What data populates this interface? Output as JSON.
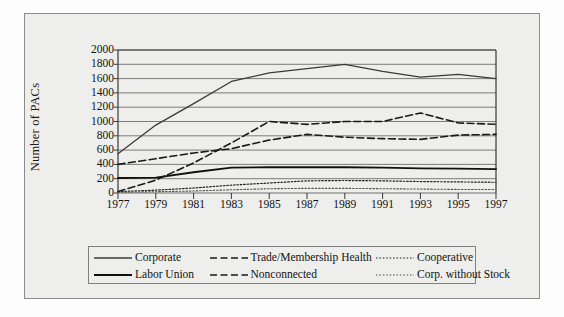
{
  "figure": {
    "background_color": "#eeeeec",
    "frame_color": "#8b8b8b"
  },
  "chart_data": {
    "type": "line",
    "title": "",
    "xlabel": "",
    "ylabel": "Number of PACs",
    "xlim": [
      1977,
      1997
    ],
    "ylim": [
      0,
      2000
    ],
    "ytick_values": [
      0,
      200,
      400,
      600,
      800,
      1000,
      1200,
      1400,
      1600,
      1800,
      2000
    ],
    "ytick_labels": [
      "0",
      "200",
      "400",
      "600",
      "800",
      "1000",
      "1200",
      "1400",
      "1600",
      "1800",
      "2000"
    ],
    "xtick_values": [
      1977,
      1979,
      1981,
      1983,
      1985,
      1987,
      1989,
      1991,
      1993,
      1995,
      1997
    ],
    "xtick_labels": [
      "1977",
      "1979",
      "1981",
      "1983",
      "1985",
      "1987",
      "1989",
      "1991",
      "1993",
      "1995",
      "1997"
    ],
    "grid": "horizontal",
    "legend_position": "below-axes",
    "x": [
      1977,
      1979,
      1981,
      1983,
      1985,
      1987,
      1989,
      1991,
      1993,
      1995,
      1997
    ],
    "series": [
      {
        "name": "Corporate",
        "style": "solid",
        "color": "#3a3a3a",
        "width": 1.3,
        "values": [
          550,
          950,
          1250,
          1560,
          1680,
          1740,
          1800,
          1700,
          1620,
          1660,
          1600
        ]
      },
      {
        "name": "Trade/Membership Health",
        "style": "dashed",
        "color": "#1a1a1a",
        "width": 1.6,
        "values": [
          400,
          480,
          560,
          620,
          740,
          820,
          780,
          760,
          750,
          810,
          820
        ]
      },
      {
        "name": "Cooperative",
        "style": "dotted",
        "color": "#222222",
        "width": 1.2,
        "values": [
          20,
          40,
          70,
          110,
          140,
          170,
          175,
          170,
          160,
          155,
          150
        ]
      },
      {
        "name": "Labor Union",
        "style": "solid",
        "color": "#101010",
        "width": 1.8,
        "values": [
          210,
          215,
          290,
          355,
          360,
          360,
          360,
          355,
          345,
          340,
          335
        ]
      },
      {
        "name": "Nonconnected",
        "style": "dashed",
        "color": "#1a1a1a",
        "width": 1.6,
        "values": [
          20,
          180,
          420,
          700,
          1000,
          960,
          1000,
          1000,
          1120,
          980,
          960
        ]
      },
      {
        "name": "Corp. without Stock",
        "style": "dotted",
        "color": "#555555",
        "width": 1.1,
        "values": [
          10,
          18,
          28,
          45,
          60,
          65,
          65,
          60,
          55,
          50,
          48
        ]
      }
    ],
    "legend_rows": [
      [
        "Corporate",
        "Trade/Membership Health",
        "Cooperative"
      ],
      [
        "Labor Union",
        "Nonconnected",
        "Corp. without Stock"
      ]
    ]
  }
}
